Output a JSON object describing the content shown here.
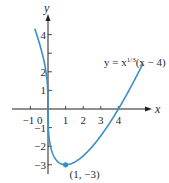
{
  "chart_data": {
    "type": "line",
    "title": "",
    "xlabel": "x",
    "ylabel": "y",
    "xlim": [
      -1.2,
      5.8
    ],
    "ylim": [
      -3.4,
      4.6
    ],
    "grid": false,
    "function": "y = x^(1/3)(x - 4)",
    "equation_label": {
      "prefix": "y = x",
      "exponent": "1/3",
      "suffix": "(x − 4)"
    },
    "x_ticks": [
      -1,
      1,
      2,
      3,
      4
    ],
    "x_tick_labels": [
      "−1",
      "1",
      "2",
      "3",
      "4"
    ],
    "origin_label": "0",
    "y_ticks": [
      -3,
      -2,
      -1,
      1,
      2,
      3,
      4
    ],
    "y_tick_labels": {
      "-3": "−3",
      "-2": "−2",
      "-1": "−1",
      "1": "1",
      "2": "2",
      "4": "4"
    },
    "series": [
      {
        "name": "y = x^(1/3)(x - 4)",
        "color": "#3a8fc7",
        "x_range": [
          -0.75,
          5.4
        ],
        "sample_points": [
          {
            "x": -0.75,
            "y": 4.32
          },
          {
            "x": -0.5,
            "y": 3.57
          },
          {
            "x": -0.25,
            "y": 2.68
          },
          {
            "x": 0,
            "y": 0
          },
          {
            "x": 0.25,
            "y": -2.36
          },
          {
            "x": 0.5,
            "y": -2.78
          },
          {
            "x": 1,
            "y": -3
          },
          {
            "x": 2,
            "y": -2.52
          },
          {
            "x": 3,
            "y": -1.44
          },
          {
            "x": 4,
            "y": 0
          },
          {
            "x": 5,
            "y": 1.71
          },
          {
            "x": 5.4,
            "y": 2.46
          }
        ]
      }
    ],
    "annotations": [
      {
        "x": 1,
        "y": -3,
        "label": "(1, −3)",
        "marker": "dot"
      }
    ]
  },
  "colors": {
    "curve": "#3a8fc7",
    "axis": "#1f1f1f",
    "text": "#2a2a2a"
  }
}
